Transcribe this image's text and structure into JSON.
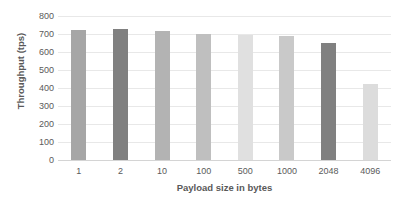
{
  "chart_data": {
    "type": "bar",
    "title": "",
    "xlabel": "Payload size in bytes",
    "ylabel": "Throughput (tps)",
    "categories": [
      "1",
      "2",
      "10",
      "100",
      "500",
      "1000",
      "2048",
      "4096"
    ],
    "values": [
      725,
      728,
      718,
      700,
      695,
      690,
      650,
      425
    ],
    "ylim": [
      0,
      800
    ],
    "yticks": [
      "0",
      "100",
      "200",
      "300",
      "400",
      "500",
      "600",
      "700",
      "800"
    ],
    "ytick_values": [
      0,
      100,
      200,
      300,
      400,
      500,
      600,
      700,
      800
    ],
    "grid": true,
    "legend": "none",
    "bar_colors": [
      "#a6a6a6",
      "#808080",
      "#b3b3b3",
      "#bfbfbf",
      "#e0e0e0",
      "#c9c9c9",
      "#808080",
      "#dcdcdc"
    ],
    "background_color": "#ffffff",
    "gridline_color": "#e8e8e8",
    "text_color": "#595959"
  }
}
